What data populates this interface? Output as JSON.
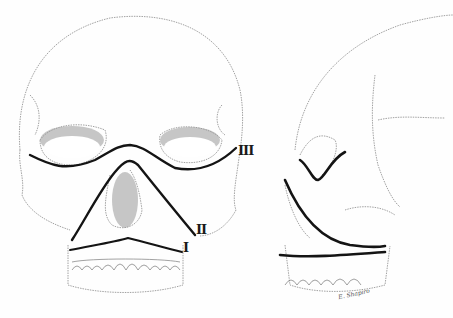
{
  "figure": {
    "views": [
      "frontal",
      "lateral"
    ],
    "labels": [
      {
        "id": "I",
        "text": "I",
        "x": 183,
        "y": 240
      },
      {
        "id": "II",
        "text": "II",
        "x": 196,
        "y": 222
      },
      {
        "id": "III",
        "text": "III",
        "x": 238,
        "y": 143
      }
    ],
    "signature": "E. Shapiro",
    "colors": {
      "line_art": "#888888",
      "fracture_line": "#141414",
      "background": "#fefefe"
    }
  }
}
